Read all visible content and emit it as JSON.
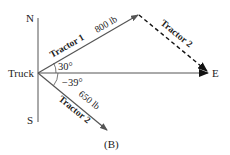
{
  "labels": {
    "north": "N",
    "south": "S",
    "east": "E",
    "origin": "Truck",
    "caption": "(B)"
  },
  "vectors": [
    {
      "name": "Tractor 1",
      "magnitude": "800 lb",
      "angle": "30°",
      "style": "solid"
    },
    {
      "name": "Tractor 2",
      "magnitude": "",
      "style": "dashed",
      "note": "translated to tip of Tractor 1"
    },
    {
      "name": "Tractor 2",
      "magnitude": "650 lb",
      "angle": "−39°",
      "style": "solid"
    }
  ],
  "colors": {
    "vector": "#555555",
    "dashed": "#111111",
    "axis": "#555555"
  }
}
